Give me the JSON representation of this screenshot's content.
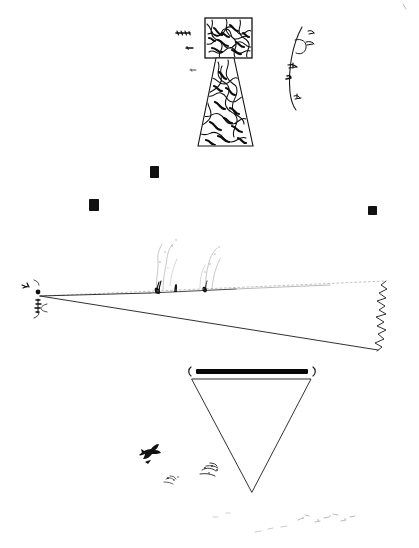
{
  "document": {
    "kind": "scanned hand-drawn diagram",
    "medium": "black ink on white paper",
    "background_color": "#ffffff",
    "ink_color": "#111111",
    "width_px": 419,
    "height_px": 548,
    "caption": "Hand-drawn black ink sketch: textured tower, arc with annotations, perspective ground wedge, inverted triangle and flying bird"
  },
  "figures": {
    "tower": {
      "label": "textured tower figure",
      "head_rect": {
        "x": 205,
        "y": 18,
        "width": 47,
        "height": 40
      },
      "pedestal": {
        "top_y": 58,
        "bottom_y": 146,
        "top_left_x": 216,
        "top_right_x": 234,
        "bottom_left_x": 198,
        "bottom_right_x": 253
      },
      "fill_style": "dense scribble texture"
    },
    "tick_marks": {
      "label": "left-hand annotation ticks",
      "marks": [
        {
          "x": 176,
          "y": 33,
          "length": 14,
          "weight": "heavy"
        },
        {
          "x": 186,
          "y": 48,
          "length": 7,
          "weight": "medium"
        },
        {
          "x": 190,
          "y": 70,
          "length": 6,
          "weight": "light"
        }
      ]
    },
    "arc": {
      "label": "annotated arc at right of tower",
      "center_x": 330,
      "notes": [
        {
          "x": 300,
          "y": 33,
          "text_glyph": "illegible handwriting"
        },
        {
          "x": 306,
          "y": 43,
          "text_glyph": "illegible handwriting"
        },
        {
          "x": 292,
          "y": 66,
          "text_glyph": "illegible handwriting"
        },
        {
          "x": 288,
          "y": 76,
          "text_glyph": "illegible handwriting"
        },
        {
          "x": 294,
          "y": 98,
          "text_glyph": "illegible handwriting"
        }
      ]
    },
    "black_squares": {
      "label": "scattered solid black squares",
      "items": [
        {
          "x": 150,
          "y": 166,
          "width": 9,
          "height": 12
        },
        {
          "x": 89,
          "y": 199,
          "width": 10,
          "height": 12
        },
        {
          "x": 368,
          "y": 206,
          "width": 9,
          "height": 9
        }
      ]
    },
    "ground_wedge": {
      "label": "perspective ground plane wedge",
      "apex": {
        "x": 40,
        "y": 296
      },
      "upper_right": {
        "x": 386,
        "y": 281
      },
      "lower_right": {
        "x": 378,
        "y": 350
      },
      "right_edge_style": "jagged squiggle"
    },
    "apex_annotation": {
      "label": "vertical handwriting at wedge apex",
      "x": 34,
      "y": 290,
      "text_glyph": "illegible vertical handwriting",
      "dot": {
        "x": 37,
        "y": 293,
        "r": 2.4
      }
    },
    "plumes": {
      "label": "faint vertical spray plumes on horizon",
      "items": [
        {
          "base_x": 158,
          "base_y": 292,
          "height": 48
        },
        {
          "base_x": 206,
          "base_y": 292,
          "height": 45
        }
      ]
    },
    "inverted_triangle": {
      "label": "inverted triangle below horizon",
      "top_left": {
        "x": 192,
        "y": 379
      },
      "top_right": {
        "x": 311,
        "y": 379
      },
      "apex": {
        "x": 252,
        "y": 492
      }
    },
    "heavy_bar": {
      "label": "thick black bar above triangle",
      "x": 196,
      "y": 369,
      "width": 112,
      "height": 5
    },
    "bracket_left": {
      "label": "left parenthesis mark",
      "glyph": "(",
      "x": 187,
      "y": 372
    },
    "bracket_right": {
      "label": "right parenthesis mark",
      "glyph": ")",
      "x": 314,
      "y": 372
    },
    "bird": {
      "label": "flying bird silhouette",
      "x": 138,
      "y": 447,
      "width": 22,
      "height": 17
    },
    "smudges": {
      "label": "small ink smudge clusters",
      "items": [
        {
          "x": 172,
          "y": 478
        },
        {
          "x": 212,
          "y": 468
        }
      ]
    },
    "bottom_specks": {
      "label": "faint scattered tick marks at bottom",
      "items": [
        {
          "x": 215,
          "y": 516
        },
        {
          "x": 228,
          "y": 513
        },
        {
          "x": 258,
          "y": 531
        },
        {
          "x": 272,
          "y": 528
        },
        {
          "x": 286,
          "y": 526
        },
        {
          "x": 300,
          "y": 519
        },
        {
          "x": 308,
          "y": 515
        },
        {
          "x": 318,
          "y": 521
        },
        {
          "x": 327,
          "y": 518
        },
        {
          "x": 336,
          "y": 514
        },
        {
          "x": 344,
          "y": 520
        },
        {
          "x": 352,
          "y": 516
        }
      ]
    },
    "corner_mark": {
      "label": "faint scan artifact top-right corner",
      "x": 404,
      "y": 6
    }
  }
}
